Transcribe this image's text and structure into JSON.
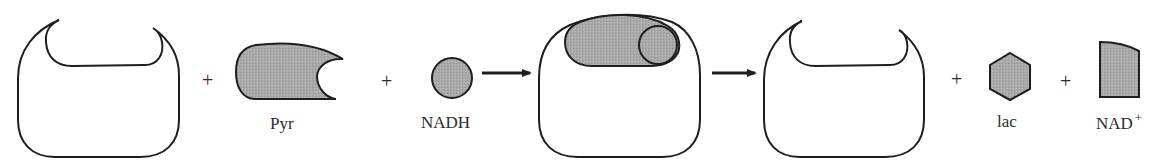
{
  "diagram": {
    "colors": {
      "stroke": "#1e1e1e",
      "fill_shaded": "#a8a8a8",
      "fill_enzyme": "#ffffff",
      "text": "#2b2b2b"
    },
    "operators": {
      "plus": "+"
    },
    "molecules": {
      "enzyme_free": {
        "shape": "enzyme-with-pocket"
      },
      "pyr": {
        "label": "Pyr",
        "shape": "crescent-blob"
      },
      "nadh": {
        "label": "NADH",
        "shape": "circle"
      },
      "complex": {
        "shape": "enzyme-with-bound-substrates"
      },
      "enzyme_released": {
        "shape": "enzyme-with-pocket"
      },
      "lac": {
        "label": "lac",
        "shape": "hexagon"
      },
      "nad_plus": {
        "label": "NAD",
        "superscript": "+",
        "shape": "truncated-block"
      }
    }
  }
}
